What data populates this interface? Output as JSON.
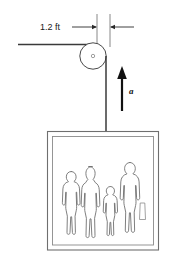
{
  "figure": {
    "background_color": "#ffffff",
    "line_color": "#3f3f3f",
    "dark_line_color": "#1a1a1a"
  },
  "dimension": {
    "label": "1.2 ft",
    "units": "ft",
    "value": 1.2
  },
  "pulley": {
    "center_marker_label": "o",
    "center_x": 93,
    "center_y": 56,
    "radius": 13
  },
  "acceleration": {
    "label": "a",
    "direction": "up"
  },
  "elevator": {
    "occupant_count": 4,
    "occupants": [
      {
        "name": "adult-left",
        "height_class": "tall"
      },
      {
        "name": "adult-center",
        "height_class": "tall"
      },
      {
        "name": "child",
        "height_class": "short"
      },
      {
        "name": "adult-right",
        "height_class": "tallest"
      }
    ]
  }
}
